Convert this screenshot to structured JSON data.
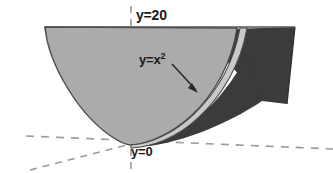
{
  "figure": {
    "background_color": "#ffffff",
    "labels": {
      "top_bound": "y=20",
      "curve": "y=x",
      "curve_exponent": "2",
      "bottom_bound": "y=0"
    },
    "colors": {
      "light_surface": "#ababab",
      "dark_surface": "#3b3b3b",
      "highlight_band": "#c9c9c9",
      "outline": "#4a4a4a",
      "axis_dash": "#9a9a9a",
      "text": "#1a1a1a",
      "arrow": "#2a2a2a"
    },
    "geometry": {
      "top_line_y": 27,
      "vertex_x": 131,
      "vertex_y": 144,
      "left_rim_x": 45,
      "right_rim_x": 295,
      "dark_corner_x": 287,
      "dark_corner_y": 104
    },
    "elements": {
      "outer_parabola": "outer parabolic cup front surface",
      "inner_surface": "dark interior surface of revolved solid",
      "rim_ellipse": "top opening rim at y=20",
      "vertical_axis": "dashed vertical y-axis",
      "horizontal_axis": "dashed horizontal x-axis",
      "depth_axis": "dashed perspective z-axis",
      "curve_pointer": "arrow from y=x^2 label to parabola edge"
    }
  }
}
